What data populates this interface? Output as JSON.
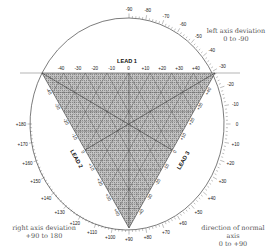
{
  "title": "",
  "annotations": {
    "left_axis_deviation": {
      "line1": "left axis deviation",
      "line2": "0 to -90"
    },
    "right_axis_deviation": {
      "line1": "right axis deviation",
      "line2": "+90 to 180"
    },
    "normal_axis": {
      "line1": "direction of normal",
      "line2": "axis",
      "line3": "0 to +90"
    }
  },
  "leads": {
    "lead1": {
      "label": "LEAD 1",
      "ticks": [
        "-40",
        "-30",
        "-20",
        "-10",
        "0",
        "+10",
        "+20",
        "+30",
        "+40"
      ]
    },
    "lead2": {
      "label": "LEAD 2",
      "ticks": [
        "-40",
        "-30",
        "-20",
        "-10",
        "0",
        "+10",
        "+20",
        "+30",
        "+40"
      ]
    },
    "lead3": {
      "label": "LEAD 3",
      "ticks": [
        "-40",
        "-30",
        "-20",
        "-10",
        "0",
        "+10",
        "+20",
        "+30",
        "+40"
      ]
    }
  },
  "axis_circle": {
    "degree_labels": [
      "-90",
      "-80",
      "-70",
      "-60",
      "-50",
      "-40",
      "-30",
      "-20",
      "-10",
      "0",
      "+10",
      "+20",
      "+30",
      "+40",
      "+50",
      "+60",
      "+70",
      "+80",
      "+90",
      "+100",
      "+110",
      "+120",
      "+130",
      "+140",
      "+150",
      "+160",
      "+170",
      "+180"
    ]
  },
  "colors": {
    "grid_fill": "#b8b8b8",
    "line": "#333333",
    "text": "#555555"
  }
}
